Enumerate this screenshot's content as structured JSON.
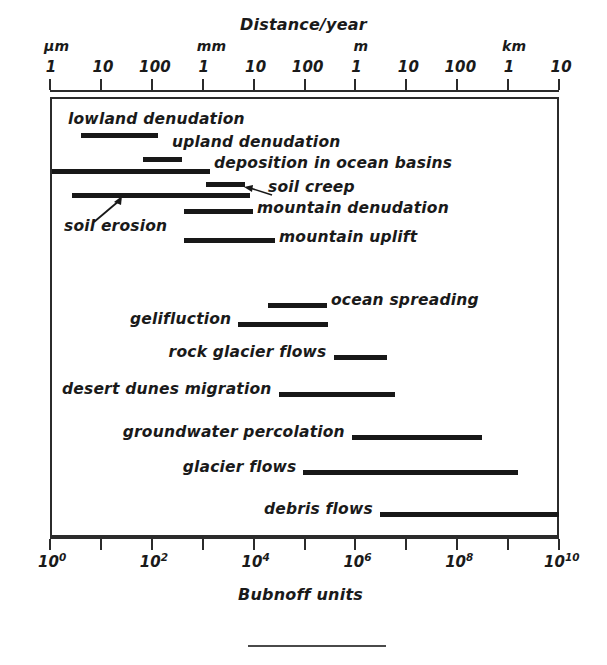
{
  "figure": {
    "top_axis_title": "Distance/year",
    "bottom_axis_title": "Bubnoff units"
  },
  "top_axis": {
    "unit_labels": [
      {
        "text": "μm",
        "decade": 0
      },
      {
        "text": "mm",
        "decade": 3
      },
      {
        "text": "m",
        "decade": 6
      },
      {
        "text": "km",
        "decade": 9
      }
    ],
    "tick_labels": [
      "1",
      "10",
      "100",
      "1",
      "10",
      "100",
      "1",
      "10",
      "100",
      "1",
      "10"
    ]
  },
  "bottom_axis": {
    "tick_labels": [
      {
        "mantissa": "10",
        "exponent": "0"
      },
      {
        "mantissa": "10",
        "exponent": "2"
      },
      {
        "mantissa": "10",
        "exponent": "4"
      },
      {
        "mantissa": "10",
        "exponent": "6"
      },
      {
        "mantissa": "10",
        "exponent": "8"
      },
      {
        "mantissa": "10",
        "exponent": "10"
      }
    ]
  },
  "annotations": {
    "soil_erosion_label": "soil erosion"
  },
  "chart_data": {
    "type": "bar",
    "title": "Distance/year",
    "subtitle": "",
    "xlabel": "Bubnoff units",
    "ylabel": "",
    "orientation": "horizontal-range",
    "xscale": "log10",
    "xlim": [
      0,
      10
    ],
    "xlim_note": "exponents of Bubnoff units, 10^0 to 10^10",
    "grid": false,
    "legend": "none",
    "x_secondary_axis": {
      "label": "Distance/year",
      "units": [
        "μm",
        "mm",
        "m",
        "km"
      ],
      "tick_labels": [
        "1",
        "10",
        "100",
        "1",
        "10",
        "100",
        "1",
        "10",
        "100",
        "1",
        "10"
      ]
    },
    "x_primary_axis": {
      "label": "Bubnoff units",
      "tick_labels": [
        "10^0",
        "10^2",
        "10^4",
        "10^6",
        "10^8",
        "10^10"
      ]
    },
    "categories": [
      "lowland denudation",
      "upland denudation",
      "deposition in ocean basins",
      "soil creep",
      "soil erosion",
      "mountain denudation",
      "mountain uplift",
      "ocean spreading",
      "gelifluction",
      "rock glacier flows",
      "desert dunes migration",
      "groundwater percolation",
      "glacier flows",
      "debris flows"
    ],
    "bars": [
      {
        "label": "lowland denudation",
        "start_exp": 0.6,
        "end_exp": 2.13,
        "row_y": 133,
        "bar_x": 81,
        "bar_w": 78,
        "label_x": 68,
        "label_y": 110,
        "label_align": "above-left"
      },
      {
        "label": "upland denudation",
        "start_exp": 1.83,
        "end_exp": 2.59,
        "row_y": 157,
        "bar_x": 143,
        "bar_w": 39,
        "label_x": 172,
        "label_y": 133,
        "label_align": "above-right"
      },
      {
        "label": "deposition in ocean basins",
        "start_exp": 0.03,
        "end_exp": 3.14,
        "row_y": 169,
        "bar_x": 51,
        "bar_w": 159,
        "label_x": 214,
        "label_y": 154,
        "label_align": "right"
      },
      {
        "label": "soil creep",
        "start_exp": 3.06,
        "end_exp": 3.83,
        "row_y": 182,
        "bar_x": 206,
        "bar_w": 39,
        "label_x": 268,
        "label_y": 178,
        "label_align": "right"
      },
      {
        "label": "soil erosion",
        "start_exp": 0.43,
        "end_exp": 3.93,
        "row_y": 193,
        "bar_x": 72,
        "bar_w": 178,
        "label_x": 64,
        "label_y": 217,
        "label_align": "below-left-arrow"
      },
      {
        "label": "mountain denudation",
        "start_exp": 2.64,
        "end_exp": 3.99,
        "row_y": 209,
        "bar_x": 184,
        "bar_w": 69,
        "label_x": 257,
        "label_y": 199,
        "label_align": "right"
      },
      {
        "label": "mountain uplift",
        "start_exp": 2.64,
        "end_exp": 4.42,
        "row_y": 238,
        "bar_x": 184,
        "bar_w": 91,
        "label_x": 279,
        "label_y": 228,
        "label_align": "right"
      },
      {
        "label": "ocean spreading",
        "start_exp": 4.29,
        "end_exp": 5.44,
        "row_y": 303,
        "bar_x": 268,
        "bar_w": 59,
        "label_x": 331,
        "label_y": 291,
        "label_align": "right"
      },
      {
        "label": "gelifluction",
        "start_exp": 3.7,
        "end_exp": 5.47,
        "row_y": 322,
        "bar_x": 238,
        "bar_w": 90,
        "label_x": 124,
        "label_y": 310,
        "label_align": "left"
      },
      {
        "label": "rock glacier flows",
        "start_exp": 5.57,
        "end_exp": 6.62,
        "row_y": 355,
        "bar_x": 333,
        "bar_w": 54,
        "label_x": 163,
        "label_y": 343,
        "label_align": "left"
      },
      {
        "label": "desert dunes migration",
        "start_exp": 4.49,
        "end_exp": 6.78,
        "row_y": 392,
        "bar_x": 278,
        "bar_w": 117,
        "label_x": 40,
        "label_y": 380,
        "label_align": "left"
      },
      {
        "label": "groundwater percolation",
        "start_exp": 5.93,
        "end_exp": 8.48,
        "row_y": 435,
        "bar_x": 352,
        "bar_w": 130,
        "label_x": 118,
        "label_y": 423,
        "label_align": "left"
      },
      {
        "label": "glacier flows",
        "start_exp": 4.98,
        "end_exp": 9.2,
        "row_y": 470,
        "bar_x": 303,
        "bar_w": 215,
        "label_x": 180,
        "label_y": 458,
        "label_align": "left"
      },
      {
        "label": "debris flows",
        "start_exp": 6.48,
        "end_exp": 10.0,
        "row_y": 512,
        "bar_x": 380,
        "bar_w": 179,
        "label_x": 267,
        "label_y": 500,
        "label_align": "left"
      }
    ]
  }
}
